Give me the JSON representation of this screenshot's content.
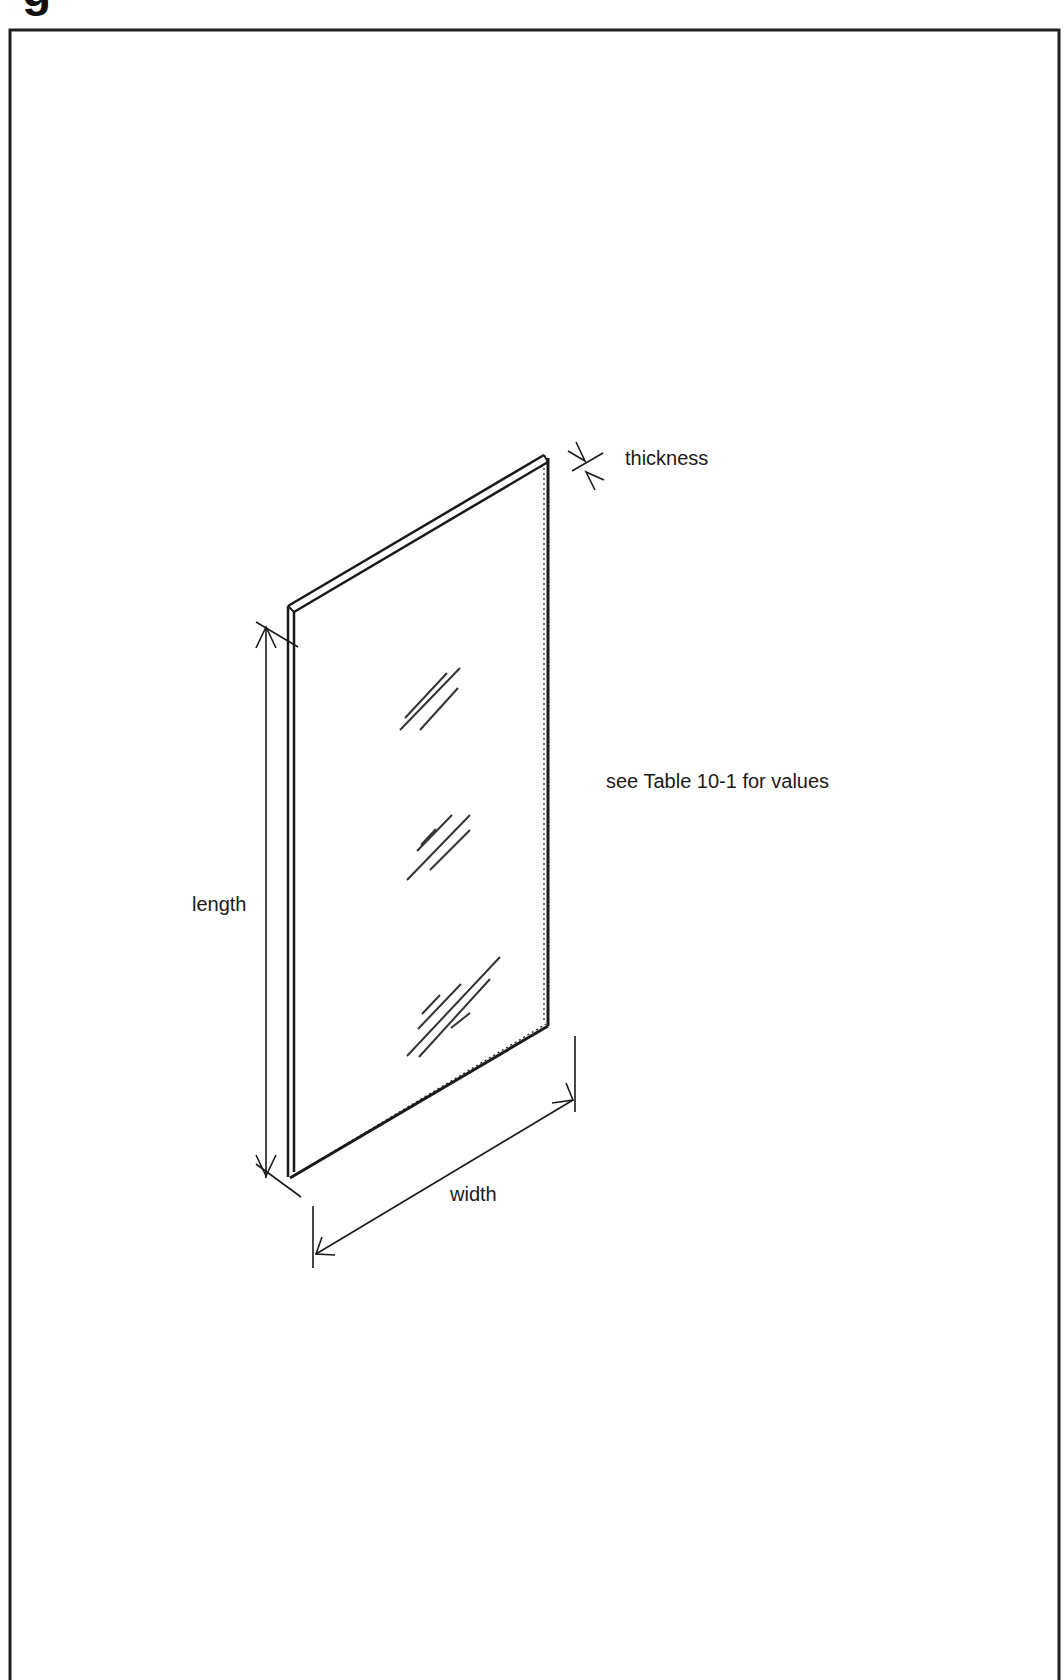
{
  "figure": {
    "title_fragment": "g",
    "labels": {
      "thickness": "thickness",
      "length": "length",
      "width": "width",
      "note": "see Table 10-1 for values"
    },
    "colors": {
      "line": "#1a1a1a",
      "background": "#ffffff"
    }
  }
}
